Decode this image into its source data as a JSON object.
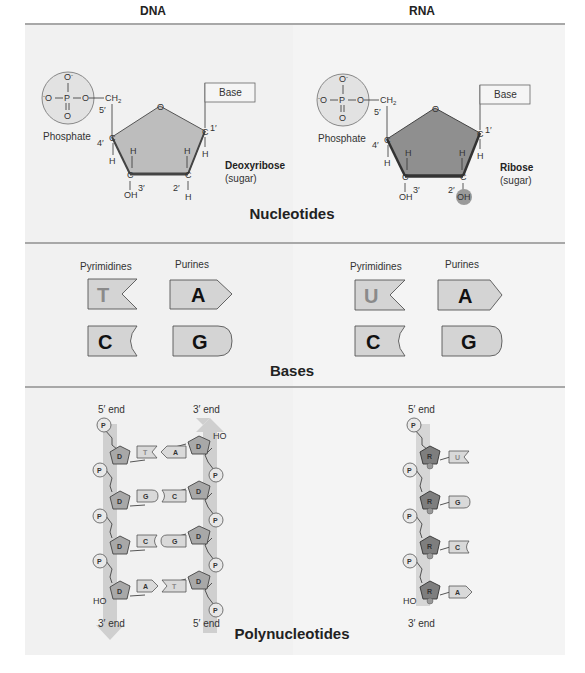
{
  "columns": {
    "dna": "DNA",
    "rna": "RNA"
  },
  "sections": {
    "nucleotides": "Nucleotides",
    "bases": "Bases",
    "polynucleotides": "Polynucleotides"
  },
  "nucleotide": {
    "phosphate_label": "Phosphate",
    "base_label": "Base",
    "dna_sugar": "Deoxyribose",
    "rna_sugar": "Ribose",
    "sugar_note": "(sugar)",
    "phosphate_atoms": {
      "top": "O⁻",
      "left": "⁻O",
      "center": "P",
      "right": "O",
      "bottom": "O"
    },
    "ch2": "CH₂",
    "carbons": {
      "c5": "5′",
      "c4": "4′",
      "c3": "3′",
      "c2": "2′",
      "c1": "1′"
    },
    "ring_oxygen": "O",
    "hydroxyl": "OH",
    "hydrogen": "H"
  },
  "bases": {
    "pyrimidines_label": "Pyrimidines",
    "purines_label": "Purines",
    "dna": {
      "pyrimidines": [
        "T",
        "C"
      ],
      "purines": [
        "A",
        "G"
      ]
    },
    "rna": {
      "pyrimidines": [
        "U",
        "C"
      ],
      "purines": [
        "A",
        "G"
      ]
    }
  },
  "polynucleotides": {
    "five_prime_end": "5′ end",
    "three_prime_end": "3′ end",
    "phosphate_symbol": "P",
    "dna_sugar_symbol": "D",
    "rna_sugar_symbol": "R",
    "hydroxyl_end": "HO",
    "dna_pairs": [
      [
        "T",
        "A"
      ],
      [
        "G",
        "C"
      ],
      [
        "C",
        "G"
      ],
      [
        "A",
        "T"
      ]
    ],
    "rna_bases": [
      "U",
      "G",
      "C",
      "A"
    ]
  },
  "colors": {
    "panel": "#f1f1f1",
    "sugar_fill_dna": "#bdbdbd",
    "sugar_fill_rna": "#8f8f8f",
    "strand_arrow": "#c9c9c9",
    "base_fill": "#d4d4d4",
    "divider": "#a8a8a8"
  }
}
